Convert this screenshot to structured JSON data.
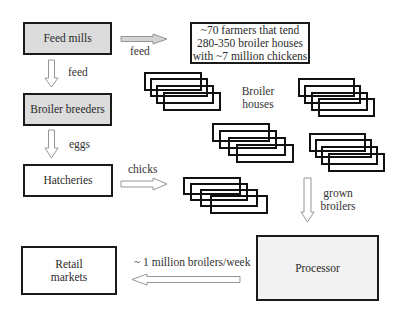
{
  "nodes": {
    "feed_mills": "Feed mills",
    "farmers": [
      "~70 farmers that tend",
      "280-350 broiler houses",
      "with ~7 million chickens"
    ],
    "broiler_breeders": "Broiler breeders",
    "hatcheries": "Hatcheries",
    "broiler_houses": [
      "Broiler",
      "houses"
    ],
    "processor": "Processor",
    "retail_markets": [
      "Retail",
      "markets"
    ]
  },
  "edges": {
    "feed_to_farmers": "feed",
    "feed_to_breeders": "feed",
    "eggs": "eggs",
    "chicks": "chicks",
    "grown_broilers": [
      "grown",
      "broilers"
    ],
    "to_retail": "~ 1 million broilers/week"
  },
  "colors": {
    "dark_fill": "#dcdcdc",
    "light_fill": "#f2f2f2",
    "border": "#1a1a1a"
  }
}
